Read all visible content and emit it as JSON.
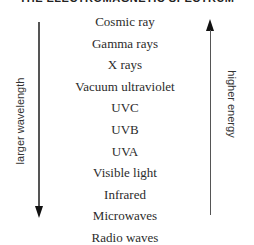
{
  "title": "THE ELECTROMAGNETIC SPECTRUM",
  "bands": [
    "Cosmic ray",
    "Gamma rays",
    "X rays",
    "Vacuum ultraviolet",
    "UVC",
    "UVB",
    "UVA",
    "Visible light",
    "Infrared",
    "Microwaves",
    "Radio waves"
  ],
  "left_axis": {
    "label": "larger wavelength",
    "direction": "down"
  },
  "right_axis": {
    "label": "higher energy",
    "direction": "up"
  }
}
